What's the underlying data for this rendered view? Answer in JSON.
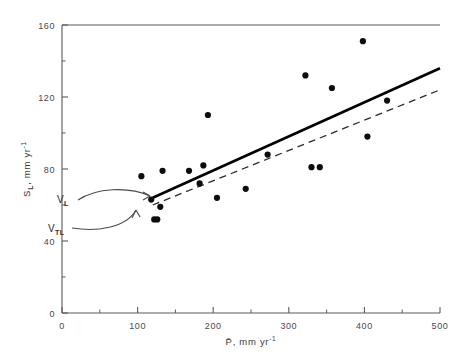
{
  "chart_data": {
    "type": "scatter",
    "title": "",
    "xlabel": "P̄, mm yr⁻¹",
    "ylabel": "Sʟ, mm yr⁻¹",
    "xlim": [
      0,
      500
    ],
    "ylim": [
      0,
      160
    ],
    "xticks": [
      0,
      100,
      200,
      300,
      400,
      500
    ],
    "xtick_labels": [
      "0",
      "100",
      "200",
      "300",
      "400",
      "500"
    ],
    "yticks": [
      0,
      40,
      80,
      120,
      160
    ],
    "ytick_labels": [
      "0",
      "40",
      "80",
      "120",
      "160"
    ],
    "xminor_ticks": [
      50,
      150,
      250,
      350,
      450
    ],
    "yminor_ticks": [
      20,
      60,
      100,
      140
    ],
    "grid": false,
    "legend": "none",
    "points": [
      {
        "x": 105,
        "y": 76
      },
      {
        "x": 118,
        "y": 63
      },
      {
        "x": 122,
        "y": 52
      },
      {
        "x": 126,
        "y": 52
      },
      {
        "x": 130,
        "y": 59
      },
      {
        "x": 133,
        "y": 79
      },
      {
        "x": 168,
        "y": 79
      },
      {
        "x": 182,
        "y": 72
      },
      {
        "x": 187,
        "y": 82
      },
      {
        "x": 193,
        "y": 110
      },
      {
        "x": 205,
        "y": 64
      },
      {
        "x": 243,
        "y": 69
      },
      {
        "x": 272,
        "y": 88
      },
      {
        "x": 322,
        "y": 132
      },
      {
        "x": 330,
        "y": 81
      },
      {
        "x": 341,
        "y": 81
      },
      {
        "x": 357,
        "y": 125
      },
      {
        "x": 398,
        "y": 151
      },
      {
        "x": 404,
        "y": 98
      },
      {
        "x": 430,
        "y": 118
      }
    ],
    "lines": [
      {
        "name": "V_L",
        "style": "solid",
        "x_start": 120,
        "y_start": 64,
        "x_end": 500,
        "y_end": 136
      },
      {
        "name": "V_TL",
        "style": "dashed",
        "x_start": 120,
        "y_start": 60,
        "x_end": 500,
        "y_end": 124
      }
    ],
    "annotations": [
      {
        "label_base": "V",
        "label_sub": "ʟ",
        "x": 52,
        "y": 76,
        "points_to_x": 155,
        "points_to_y": 76
      },
      {
        "label_base": "V",
        "label_sub": "Tʟ",
        "x": 42,
        "y": 52,
        "points_to_x": 140,
        "points_to_y": 57
      }
    ]
  },
  "axis": {
    "x_title": "P̄, mm yr",
    "x_title_sup": "-1",
    "y_title_base": "S",
    "y_title_sub": "L",
    "y_title_rest": ", mm yr",
    "y_title_sup": "-1"
  },
  "annotations": {
    "upper": {
      "base": "V",
      "sub": "L"
    },
    "lower": {
      "base": "V",
      "sub": "TL"
    }
  }
}
